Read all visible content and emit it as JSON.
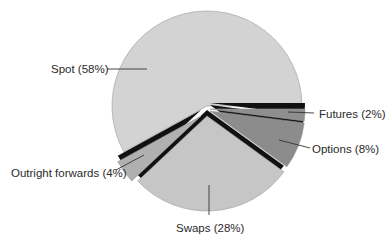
{
  "chart_data": {
    "type": "pie",
    "title": "",
    "slices": [
      {
        "label": "Spot",
        "value": 58,
        "text": "Spot (58%)",
        "color": "#d3d3d3"
      },
      {
        "label": "Futures",
        "value": 2,
        "text": "Futures (2%)",
        "color": "#8e8e8e"
      },
      {
        "label": "Options",
        "value": 8,
        "text": "Options (8%)",
        "color": "#8c8c8c"
      },
      {
        "label": "Swaps",
        "value": 28,
        "text": "Swaps (28%)",
        "color": "#c6c6c6"
      },
      {
        "label": "Outright forwards",
        "value": 4,
        "text": "Outright forwards (4%)",
        "color": "#b0b0b0"
      }
    ],
    "exploded": [
      "Futures",
      "Options",
      "Swaps",
      "Outright forwards"
    ],
    "legend": "none",
    "unit": "%"
  },
  "labels": {
    "spot": "Spot (58%)",
    "futures": "Futures (2%)",
    "options": "Options (8%)",
    "swaps": "Swaps (28%)",
    "forwards": "Outright forwards (4%)"
  }
}
